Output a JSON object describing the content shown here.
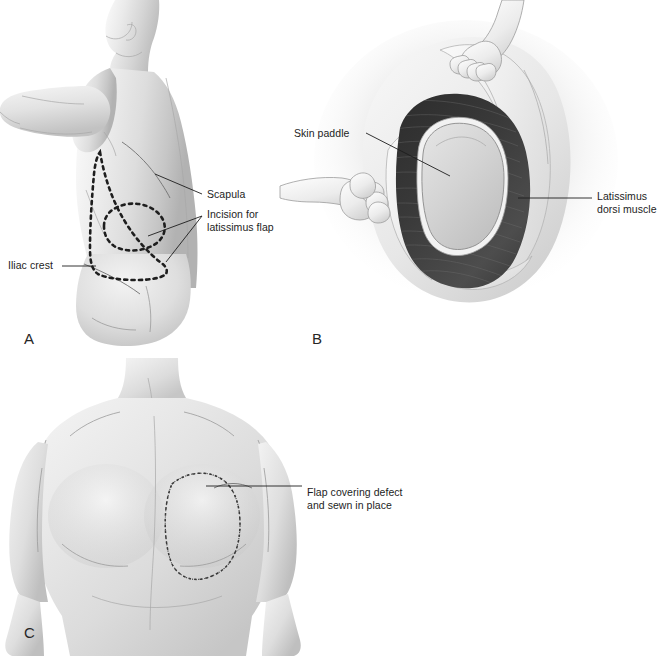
{
  "figure": {
    "background_color": "#ffffff",
    "ink_color": "#1d1d1d",
    "style": "grayscale medical illustration"
  },
  "panels": [
    {
      "id": "A",
      "letter": "A",
      "view": "posterolateral back and trunk, arm abducted forward",
      "description": "Back of a patient with dashed outline of the latissimus dorsi flap and skin paddle marked on the skin"
    },
    {
      "id": "B",
      "letter": "B",
      "view": "intraoperative close-up of the back wound",
      "description": "Retracted skin and subcutaneous fat exposing the latissimus dorsi muscle with the island skin paddle outlined on its surface; two gloved hands retract the wound edges"
    },
    {
      "id": "C",
      "letter": "C",
      "view": "anterior chest, arms at sides",
      "description": "Anterior chest wall with the transferred flap sutured in place over the defect"
    }
  ],
  "labels": [
    {
      "id": "scapula",
      "text": "Scapula",
      "panel": "A",
      "leader": "line from label to inferior border of scapula"
    },
    {
      "id": "incision-for-latissimus-flap",
      "text": "Incision for\nlatissimus flap",
      "panel": "A",
      "leader": "two lines from label to the dashed flap outline and skin paddle"
    },
    {
      "id": "iliac-crest",
      "text": "Iliac crest",
      "panel": "A",
      "leader": "line from label to the iliac crest contour"
    },
    {
      "id": "skin-paddle",
      "text": "Skin paddle",
      "panel": "B",
      "leader": "line from label to the oval skin paddle on the muscle"
    },
    {
      "id": "latissimus-dorsi-muscle",
      "text": "Latissimus\ndorsi muscle",
      "panel": "B",
      "leader": "line from label to the striated dark muscle belly"
    },
    {
      "id": "flap-covering-defect",
      "text": "Flap covering defect\nand sewn in place",
      "panel": "C",
      "leader": "line from label to the sutured flap on the chest"
    }
  ],
  "colors": {
    "background": "#ffffff",
    "skin_light": "#f4f4f4",
    "skin_mid": "#d8d8d8",
    "skin_shadow": "#a9a9a9",
    "muscle_dark": "#2e2e2e",
    "muscle_mid": "#4a4a4a",
    "skin_paddle": "#cfcfcf",
    "fat_layer": "#ececec",
    "ink": "#1d1d1d",
    "leader_line": "#1d1d1d"
  }
}
